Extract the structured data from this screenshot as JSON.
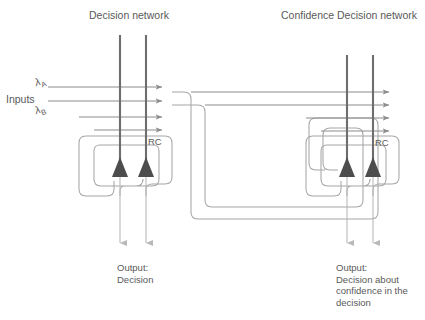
{
  "figure": {
    "titles": {
      "left": "Decision network",
      "right": "Confidence Decision network"
    },
    "inputs": {
      "label": "Inputs",
      "lambda_a": "λ",
      "lambda_a_sub": "A",
      "lambda_b": "λ",
      "lambda_b_sub": "B"
    },
    "annotations": {
      "rc_left": "RC",
      "rc_right": "RC"
    },
    "outputs": {
      "left_line1": "Output:",
      "left_line2": "Decision",
      "right_line1": "Output:",
      "right_line2": "Decision about",
      "right_line3": "confidence in the",
      "right_line4": "decision"
    },
    "colors": {
      "text": "#595959",
      "dendrite": "#6e6e6e",
      "soma": "#4d4d4d",
      "axon": "#b3b3b3",
      "wire": "#a6a6a6",
      "input_line": "#8c8c8c",
      "background": "#ffffff"
    }
  }
}
